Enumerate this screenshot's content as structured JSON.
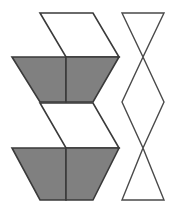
{
  "figure": {
    "canvas": {
      "width": 172,
      "height": 213,
      "background": "#ffffff"
    },
    "colors": {
      "shaded_face": "#808080",
      "unshaded_face": "#ffffff",
      "outline": "#3a3a3a",
      "net_outline": "#4a4a4a",
      "background": "#ffffff"
    },
    "shapes": [
      {
        "id": "hexagon-top",
        "name": "upper-cube-hexagon",
        "kind": "hexagon-split-into-three-rhombi",
        "center": {
          "x": 66,
          "y": 57
        },
        "vertices": [
          {
            "x": 40,
            "y": 13
          },
          {
            "x": 93,
            "y": 13
          },
          {
            "x": 119,
            "y": 57
          },
          {
            "x": 93,
            "y": 102
          },
          {
            "x": 40,
            "y": 102
          },
          {
            "x": 12,
            "y": 57
          }
        ],
        "faces": [
          {
            "id": "top-face",
            "name": "top-rhombus",
            "fill": "#ffffff",
            "points": "40,13 93,13 119,57 66,57"
          },
          {
            "id": "left-face",
            "name": "left-rhombus",
            "fill": "#808080",
            "points": "12,57 66,57 66,102 40,102"
          },
          {
            "id": "right-face",
            "name": "right-rhombus",
            "fill": "#808080",
            "points": "66,57 119,57 93,102 66,102"
          }
        ]
      },
      {
        "id": "hexagon-bottom",
        "name": "lower-cube-hexagon",
        "kind": "hexagon-split-into-three-rhombi",
        "center": {
          "x": 66,
          "y": 148
        },
        "vertices": [
          {
            "x": 40,
            "y": 103
          },
          {
            "x": 93,
            "y": 103
          },
          {
            "x": 119,
            "y": 148
          },
          {
            "x": 93,
            "y": 200
          },
          {
            "x": 40,
            "y": 200
          },
          {
            "x": 12,
            "y": 148
          }
        ],
        "faces": [
          {
            "id": "top-face",
            "name": "top-rhombus",
            "fill": "#ffffff",
            "points": "40,103 93,103 119,148 66,148"
          },
          {
            "id": "left-face",
            "name": "left-rhombus",
            "fill": "#808080",
            "points": "12,148 66,148 66,200 40,200"
          },
          {
            "id": "right-face",
            "name": "right-rhombus",
            "fill": "#808080",
            "points": "66,148 119,148 93,200 66,200"
          }
        ]
      },
      {
        "id": "triangle-strip",
        "name": "zigzag-triangle-net",
        "kind": "crossed-triangle-outline-strip",
        "bounds": {
          "left": 122,
          "top": 13,
          "right": 164,
          "bottom": 200
        },
        "polylines": [
          {
            "id": "strip-path-a",
            "name": "left-zigzag-polyline",
            "points": "122,13 164,13 122,200 164,200"
          },
          {
            "id": "strip-path-b",
            "name": "right-zigzag-polyline",
            "points": "164,13 122,102 164,102 122,13"
          }
        ],
        "paths": [
          {
            "id": "net-outline-left",
            "name": "left-descending-chain",
            "d": "M 122,13 L 164,13 L 143,57 L 164,102 L 143,148 L 164,200 L 122,200 L 143,148 L 122,102 L 143,57 Z"
          }
        ],
        "crossing_points": [
          {
            "x": 143,
            "y": 57
          },
          {
            "x": 143,
            "y": 148
          }
        ],
        "waist_points": [
          {
            "x": 122,
            "y": 102
          },
          {
            "x": 164,
            "y": 102
          }
        ]
      }
    ]
  }
}
